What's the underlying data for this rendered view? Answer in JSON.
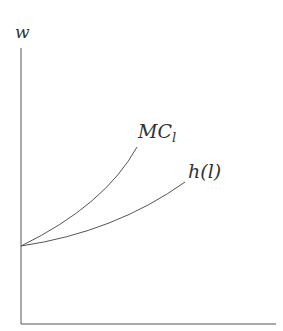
{
  "diagram": {
    "y_axis_label": "w",
    "curves": [
      {
        "name": "MC",
        "subscript": "l",
        "description": "marginal cost of labor, convex, steeper"
      },
      {
        "name": "h(l)",
        "description": "labor supply curve, convex, flatter"
      }
    ],
    "colors": {
      "line": "#555555",
      "text": "#333333"
    }
  }
}
